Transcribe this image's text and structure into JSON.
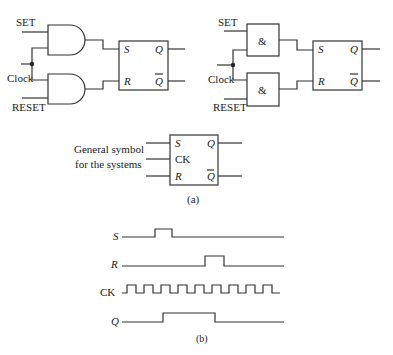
{
  "circuit_and": {
    "inputs": {
      "set": "SET",
      "clock": "Clock",
      "reset": "RESET"
    },
    "flipflop": {
      "s": "S",
      "r": "R",
      "q": "Q",
      "qbar": "Q"
    }
  },
  "circuit_ieee": {
    "inputs": {
      "set": "SET",
      "clock": "Clock",
      "reset": "RESET"
    },
    "gate_label": "&",
    "flipflop": {
      "s": "S",
      "r": "R",
      "q": "Q",
      "qbar": "Q"
    }
  },
  "general_symbol": {
    "caption_line1": "General symbol",
    "caption_line2": "for the systems",
    "s": "S",
    "ck": "CK",
    "r": "R",
    "q": "Q",
    "qbar": "Q"
  },
  "part_a_label": "(a)",
  "timing": {
    "signals": [
      {
        "name": "S",
        "label": "S"
      },
      {
        "name": "R",
        "label": "R"
      },
      {
        "name": "CK",
        "label": "CK"
      },
      {
        "name": "Q",
        "label": "Q"
      }
    ]
  },
  "part_b_label": "(b)"
}
